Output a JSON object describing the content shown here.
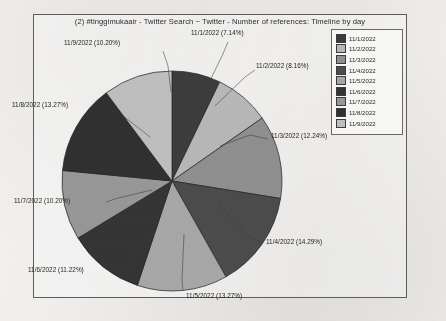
{
  "chart": {
    "title": "(2) #tinggimukaair - Twitter Search ~ Twitter - Number of references: Timeline by day"
  },
  "legend": {
    "items": [
      {
        "label": "11/1/2022",
        "color": "#3b3b3b"
      },
      {
        "label": "11/2/2022",
        "color": "#b9b9b9"
      },
      {
        "label": "11/3/2022",
        "color": "#8f8f8f"
      },
      {
        "label": "11/4/2022",
        "color": "#4a4a4a"
      },
      {
        "label": "11/5/2022",
        "color": "#a8a8a8"
      },
      {
        "label": "11/6/2022",
        "color": "#333333"
      },
      {
        "label": "11/7/2022",
        "color": "#989898"
      },
      {
        "label": "11/8/2022",
        "color": "#2f2f2f"
      },
      {
        "label": "11/9/2022",
        "color": "#c0c0c0"
      }
    ]
  },
  "labels": {
    "d1": "11/1/2022 (7.14%)",
    "d2": "11/2/2022 (8.16%)",
    "d3": "11/3/2022 (12.24%)",
    "d4": "11/4/2022 (14.29%)",
    "d5": "11/5/2022 (13.27%)",
    "d6": "11/6/2022 (11.22%)",
    "d7": "11/7/2022 (10.20%)",
    "d8": "11/8/2022 (13.27%)",
    "d9": "11/9/2022 (10.20%)"
  },
  "chart_data": {
    "type": "pie",
    "title": "(2) #tinggimukaair - Twitter Search ~ Twitter - Number of references: Timeline by day",
    "xlabel": "",
    "ylabel": "",
    "legend_position": "right",
    "grid": false,
    "start_angle_deg": 90,
    "direction": "clockwise",
    "categories": [
      "11/1/2022",
      "11/2/2022",
      "11/3/2022",
      "11/4/2022",
      "11/5/2022",
      "11/6/2022",
      "11/7/2022",
      "11/8/2022",
      "11/9/2022"
    ],
    "values": [
      7.14,
      8.16,
      12.24,
      14.29,
      13.27,
      11.22,
      10.2,
      13.27,
      10.2
    ],
    "value_unit": "percent",
    "colors": [
      "#3b3b3b",
      "#b9b9b9",
      "#8f8f8f",
      "#4a4a4a",
      "#a8a8a8",
      "#333333",
      "#989898",
      "#2f2f2f",
      "#c0c0c0"
    ],
    "data_labels": [
      "11/1/2022 (7.14%)",
      "11/2/2022 (8.16%)",
      "11/3/2022 (12.24%)",
      "11/4/2022 (14.29%)",
      "11/5/2022 (13.27%)",
      "11/6/2022 (11.22%)",
      "11/7/2022 (10.20%)",
      "11/8/2022 (13.27%)",
      "11/9/2022 (10.20%)"
    ]
  }
}
